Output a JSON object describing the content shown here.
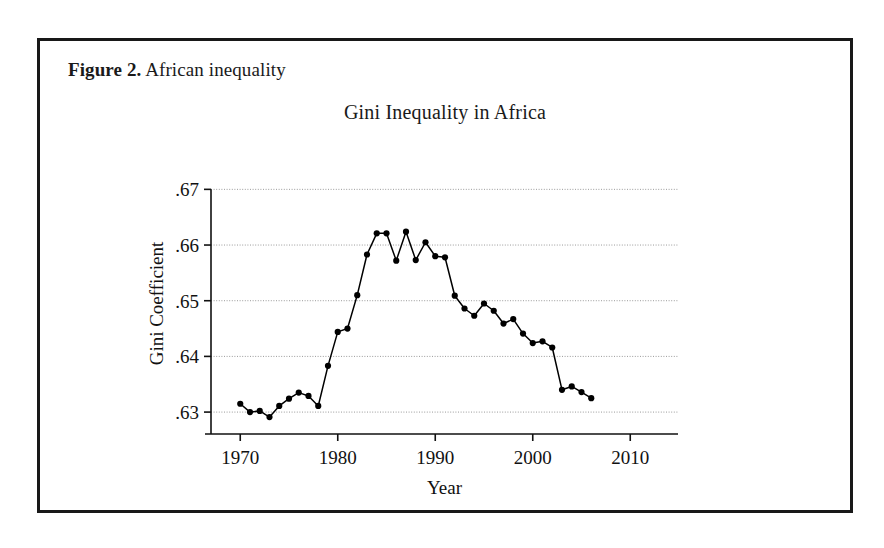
{
  "figure": {
    "caption_label": "Figure 2.",
    "caption_text": "African inequality"
  },
  "chart_data": {
    "type": "line",
    "title": "Gini Inequality in Africa",
    "xlabel": "Year",
    "ylabel": "Gini Coefficient",
    "xlim": [
      1967,
      2011
    ],
    "ylim": [
      0.6275,
      0.6715
    ],
    "xticks": [
      1970,
      1980,
      1990,
      2000,
      2010
    ],
    "xtick_labels": [
      "1970",
      "1980",
      "1990",
      "2000",
      "2010"
    ],
    "yticks": [
      0.63,
      0.64,
      0.65,
      0.66,
      0.67
    ],
    "ytick_labels": [
      ".63",
      ".64",
      ".65",
      ".66",
      ".67"
    ],
    "grid": true,
    "grid_axis": "y",
    "legend": null,
    "marker": "filled-circle",
    "line_color": "#000000",
    "marker_color": "#000000",
    "grid_color": "#9a9a9a",
    "x": [
      1970,
      1971,
      1972,
      1973,
      1974,
      1975,
      1976,
      1977,
      1978,
      1979,
      1980,
      1981,
      1982,
      1983,
      1984,
      1985,
      1986,
      1987,
      1988,
      1989,
      1990,
      1991,
      1992,
      1993,
      1994,
      1995,
      1996,
      1997,
      1998,
      1999,
      2000,
      2001,
      2002,
      2003,
      2004,
      2005,
      2006
    ],
    "values": [
      0.6315,
      0.63,
      0.6302,
      0.6291,
      0.6311,
      0.6324,
      0.6335,
      0.6329,
      0.6311,
      0.6383,
      0.6444,
      0.645,
      0.651,
      0.6583,
      0.6621,
      0.6621,
      0.6572,
      0.6624,
      0.6573,
      0.6605,
      0.658,
      0.6578,
      0.6509,
      0.6486,
      0.6473,
      0.6495,
      0.6482,
      0.6459,
      0.6467,
      0.6441,
      0.6424,
      0.6427,
      0.6416,
      0.634,
      0.6346,
      0.6336,
      0.6325
    ]
  }
}
